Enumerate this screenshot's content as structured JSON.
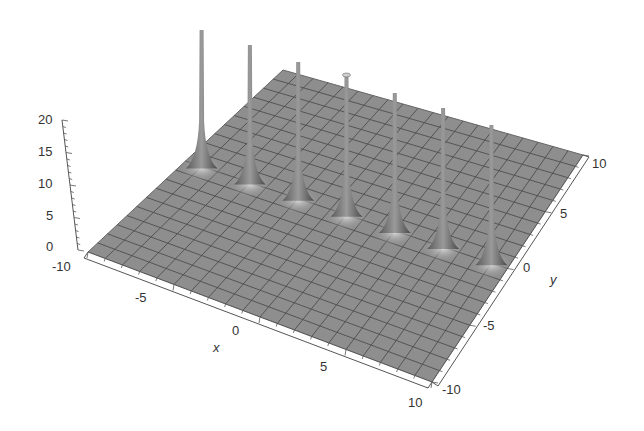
{
  "chart_data": {
    "type": "surface3d",
    "title": "",
    "xlabel": "x",
    "ylabel": "y",
    "zlabel": "",
    "xlim": [
      -10,
      10
    ],
    "ylim": [
      -10,
      10
    ],
    "zlim": [
      0,
      20
    ],
    "x_ticks": [
      "-10",
      "-5",
      "0",
      "5",
      "10"
    ],
    "y_ticks": [
      "-10",
      "-5",
      "0",
      "5",
      "10"
    ],
    "z_ticks": [
      "0",
      "5",
      "10",
      "15",
      "20"
    ],
    "mesh": true,
    "surface_color": "#8c8c8c",
    "spikes": [
      {
        "x": -9,
        "y": 0,
        "z": 20
      },
      {
        "x": -6,
        "y": 0,
        "z": 20
      },
      {
        "x": -3,
        "y": 0,
        "z": 20
      },
      {
        "x": 0,
        "y": 0,
        "z": 20
      },
      {
        "x": 3,
        "y": 0,
        "z": 20
      },
      {
        "x": 6,
        "y": 0,
        "z": 20
      },
      {
        "x": 9,
        "y": 0,
        "z": 20
      }
    ]
  }
}
